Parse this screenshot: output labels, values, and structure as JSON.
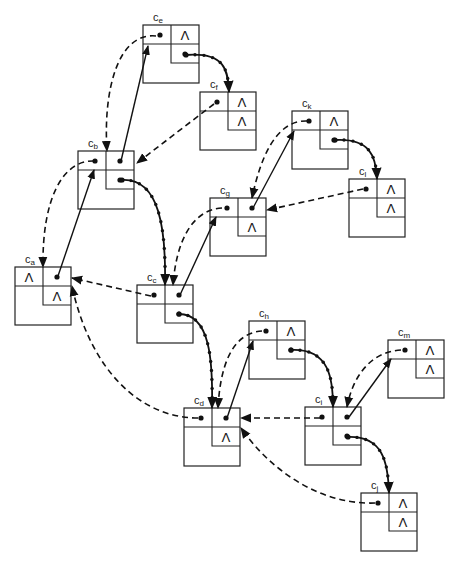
{
  "diagram": {
    "type": "threaded binary tree linked representation",
    "lambda_symbol": "Λ",
    "nodes": [
      {
        "id": "a",
        "label": "c",
        "sub": "a",
        "x": 15,
        "y": 267,
        "left": "Λ",
        "right_link": "dot",
        "rtag": "Λ"
      },
      {
        "id": "b",
        "label": "c",
        "sub": "b",
        "x": 78,
        "y": 151,
        "left": "dot",
        "right_link": "dot",
        "rtag": "dot"
      },
      {
        "id": "c",
        "label": "c",
        "sub": "c",
        "x": 137,
        "y": 285,
        "left": "dot",
        "right_link": "dot",
        "rtag": "dot"
      },
      {
        "id": "d",
        "label": "c",
        "sub": "d",
        "x": 184,
        "y": 408,
        "left": "dot",
        "right_link": "dot",
        "rtag": "Λ"
      },
      {
        "id": "e",
        "label": "c",
        "sub": "e",
        "x": 143,
        "y": 25,
        "left": "dot",
        "right_link": "Λ",
        "rtag": "dot"
      },
      {
        "id": "f",
        "label": "c",
        "sub": "f",
        "x": 200,
        "y": 92,
        "left": "dot",
        "right_link": "Λ",
        "rtag": "Λ"
      },
      {
        "id": "g",
        "label": "c",
        "sub": "g",
        "x": 210,
        "y": 198,
        "left": "dot",
        "right_link": "dot",
        "rtag": "Λ"
      },
      {
        "id": "h",
        "label": "c",
        "sub": "h",
        "x": 249,
        "y": 321,
        "left": "dot",
        "right_link": "Λ",
        "rtag": "dot"
      },
      {
        "id": "i",
        "label": "c",
        "sub": "i",
        "x": 305,
        "y": 407,
        "left": "dot",
        "right_link": "dot",
        "rtag": "dot"
      },
      {
        "id": "j",
        "label": "c",
        "sub": "j",
        "x": 361,
        "y": 493,
        "left": "dot",
        "right_link": "Λ",
        "rtag": "Λ"
      },
      {
        "id": "k",
        "label": "c",
        "sub": "k",
        "x": 292,
        "y": 111,
        "left": "dot",
        "right_link": "Λ",
        "rtag": "dot"
      },
      {
        "id": "l",
        "label": "c",
        "sub": "l",
        "x": 349,
        "y": 179,
        "left": "dot",
        "right_link": "Λ",
        "rtag": "Λ"
      },
      {
        "id": "m",
        "label": "c",
        "sub": "m",
        "x": 388,
        "y": 340,
        "left": "dot",
        "right_link": "Λ",
        "rtag": "Λ"
      }
    ],
    "edges": {
      "solid_parent_links": [
        [
          "a",
          "b"
        ],
        [
          "b",
          "e"
        ],
        [
          "c",
          "g"
        ],
        [
          "g",
          "k"
        ],
        [
          "d",
          "h"
        ],
        [
          "i",
          "m"
        ],
        [
          "d",
          "c"
        ]
      ],
      "dashed_links": [
        [
          "b",
          "a"
        ],
        [
          "e",
          "b"
        ],
        [
          "f",
          "b"
        ],
        [
          "g",
          "c"
        ],
        [
          "k",
          "g"
        ],
        [
          "l",
          "g"
        ],
        [
          "c",
          "a"
        ],
        [
          "d",
          "a"
        ],
        [
          "h",
          "d"
        ],
        [
          "i",
          "d"
        ],
        [
          "m",
          "i"
        ],
        [
          "j",
          "i"
        ]
      ],
      "thread_links": [
        [
          "e",
          "f"
        ],
        [
          "b",
          "c"
        ],
        [
          "k",
          "l"
        ],
        [
          "c",
          "d"
        ],
        [
          "h",
          "i"
        ],
        [
          "i",
          "j"
        ]
      ]
    }
  }
}
